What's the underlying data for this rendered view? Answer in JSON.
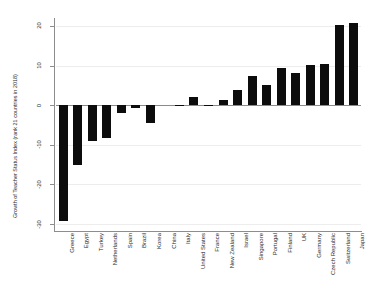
{
  "chart_data": {
    "type": "bar",
    "title": "",
    "xlabel": "",
    "ylabel": "Growth of Teacher Status Index (rank 21 countries in 2018)",
    "ylim": [
      -32,
      22
    ],
    "yticks": [
      20,
      10,
      0,
      -10,
      -20,
      -30
    ],
    "ytick_labels": [
      "20",
      "10",
      "0",
      "-10",
      "-20",
      "-30"
    ],
    "grid": true,
    "legend": "none",
    "bar_color": "#0c0c0c",
    "categories": [
      "Greece",
      "Egypt",
      "Turkey",
      "Netherlands",
      "Spain",
      "Brazil",
      "Korea",
      "China",
      "Italy",
      "United States",
      "France",
      "New Zealand",
      "Israel",
      "Singapore",
      "Portugal",
      "Finland",
      "UK",
      "Germany",
      "Czech Republic",
      "Switzerland",
      "Japan"
    ],
    "values": [
      -29.3,
      -15.2,
      -9.0,
      -8.3,
      -2.0,
      -0.8,
      -4.6,
      0.0,
      0.1,
      2.1,
      0.1,
      1.3,
      3.9,
      7.4,
      5.1,
      9.4,
      8.0,
      10.1,
      10.3,
      20.2,
      20.8
    ]
  },
  "title_sliver": {
    "text": ""
  }
}
